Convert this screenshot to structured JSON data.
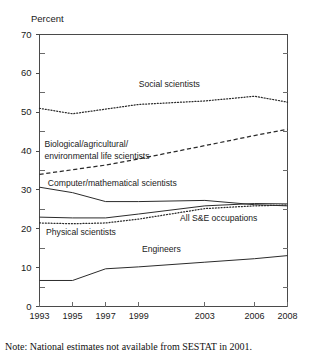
{
  "chart_data": {
    "type": "line",
    "title": "",
    "subtitle": "",
    "xlabel": "",
    "ylabel": "Percent",
    "ylim": [
      0,
      70
    ],
    "ytick_values": [
      0,
      10,
      20,
      30,
      40,
      50,
      60,
      70
    ],
    "yminor_tick_values": [
      5,
      15,
      25,
      35,
      45,
      55,
      65
    ],
    "ytick_labels": [
      "0",
      "10",
      "20",
      "30",
      "40",
      "50",
      "60",
      "70"
    ],
    "grid": false,
    "legend_position": "inline-annotations",
    "x": [
      1993,
      1995,
      1997,
      1999,
      2003,
      2006,
      2008
    ],
    "xtick_labels": [
      "1993",
      "1995",
      "1997",
      "1999",
      "2003",
      "2006",
      "2008"
    ],
    "series": [
      {
        "name": "Social scientists",
        "style": "dotted",
        "values": [
          51.0,
          49.6,
          50.8,
          52.0,
          52.9,
          54.1,
          52.6
        ]
      },
      {
        "name": "Biological/agricultural/\nenvironmental life scientists",
        "style": "dashed",
        "values": [
          34.0,
          35.2,
          36.4,
          38.0,
          41.4,
          44.0,
          45.6
        ]
      },
      {
        "name": "Computer/mathematical scientists",
        "style": "solid",
        "values": [
          30.7,
          29.3,
          27.0,
          27.0,
          27.3,
          26.2,
          25.9
        ]
      },
      {
        "name": "All S&E occupations",
        "style": "solid",
        "values": [
          23.0,
          22.8,
          22.8,
          23.8,
          25.9,
          26.5,
          26.4
        ]
      },
      {
        "name": "Physical scientists",
        "style": "dotted",
        "values": [
          21.5,
          21.3,
          21.5,
          22.5,
          25.2,
          25.9,
          26.1
        ]
      },
      {
        "name": "Engineers",
        "style": "solid",
        "values": [
          6.7,
          6.7,
          9.7,
          10.2,
          11.4,
          12.3,
          13.1
        ]
      }
    ],
    "annotations": [
      {
        "text": "Social scientists",
        "x": 1999,
        "y": 57
      },
      {
        "text": "Biological/agricultural/",
        "x": 1993.3,
        "y": 41.5
      },
      {
        "text": "environmental life scientists",
        "x": 1993.3,
        "y": 38.5
      },
      {
        "text": "Computer/mathematical scientists",
        "x": 1993.5,
        "y": 31.5
      },
      {
        "text": "All S&E occupations",
        "x": 2001.5,
        "y": 22.5
      },
      {
        "text": "Physical scientists",
        "x": 1993.4,
        "y": 19.0
      },
      {
        "text": "Engineers",
        "x": 1999.2,
        "y": 14.5
      }
    ],
    "note": "Note: National estimates not available from SESTAT in 2001."
  },
  "axis": {
    "ylabel": "Percent"
  },
  "footnote": {
    "text": "Note: National estimates not available from SESTAT in 2001."
  },
  "colors": {
    "line": "#2b2b2b",
    "axis": "#555555",
    "text": "#1a1a1a",
    "background": "#ffffff"
  }
}
